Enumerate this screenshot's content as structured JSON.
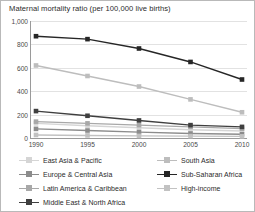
{
  "chart_data": {
    "type": "line",
    "title": "Maternal mortality ratio (per 100,000 live births)",
    "xlabel": "",
    "ylabel": "",
    "x": [
      1990,
      1995,
      2000,
      2005,
      2010
    ],
    "xticklabels": [
      "1990",
      "1995",
      "2000",
      "2005",
      "2010"
    ],
    "yticks": [
      0,
      200,
      400,
      600,
      800,
      1000
    ],
    "yticklabels": [
      "0",
      "200",
      "400",
      "600",
      "800",
      "1,000"
    ],
    "ylim": [
      0,
      1000
    ],
    "xlim": [
      1990,
      2010
    ],
    "grid": "horizontal",
    "legend_position": "below",
    "series": [
      {
        "name": "East Asia & Pacific",
        "color": "#d5d5d5",
        "values": [
          125,
          105,
          88,
          70,
          60
        ]
      },
      {
        "name": "South Asia",
        "color": "#bdbdbd",
        "values": [
          620,
          530,
          440,
          330,
          220
        ]
      },
      {
        "name": "Europe & Central Asia",
        "color": "#8c8c8c",
        "values": [
          78,
          64,
          50,
          38,
          32
        ]
      },
      {
        "name": "Sub-Saharan Africa",
        "color": "#262626",
        "values": [
          870,
          845,
          765,
          650,
          500
        ]
      },
      {
        "name": "Latin America & Caribbean",
        "color": "#a8a8a8",
        "values": [
          140,
          125,
          110,
          95,
          80
        ]
      },
      {
        "name": "High-income",
        "color": "#c2c2c2",
        "values": [
          26,
          22,
          18,
          16,
          14
        ]
      },
      {
        "name": "Middle East & North Africa",
        "color": "#3f3f3f",
        "values": [
          230,
          190,
          150,
          110,
          95
        ]
      }
    ]
  },
  "legend": {
    "rows": [
      {
        "left": {
          "label": "East Asia & Pacific",
          "color": "#d5d5d5"
        },
        "right": {
          "label": "South Asia",
          "color": "#bdbdbd"
        }
      },
      {
        "left": {
          "label": "Europe & Central Asia",
          "color": "#8c8c8c"
        },
        "right": {
          "label": "Sub-Saharan Africa",
          "color": "#262626"
        }
      },
      {
        "left": {
          "label": "Latin America & Caribbean",
          "color": "#a8a8a8"
        },
        "right": {
          "label": "High-income",
          "color": "#c2c2c2"
        }
      },
      {
        "left": {
          "label": "Middle East & North Africa",
          "color": "#3f3f3f"
        },
        "right": null
      }
    ]
  }
}
